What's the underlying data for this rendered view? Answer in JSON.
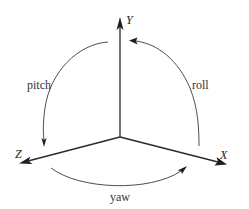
{
  "diagram": {
    "title": "",
    "axes": [
      {
        "id": "y",
        "label": "Y",
        "direction": "up"
      },
      {
        "id": "z",
        "label": "Z",
        "direction": "lower-left"
      },
      {
        "id": "x",
        "label": "X",
        "direction": "lower-right"
      }
    ],
    "rotations": [
      {
        "id": "pitch",
        "label": "pitch",
        "from_axis": "Y",
        "to_axis": "Z"
      },
      {
        "id": "roll",
        "label": "roll",
        "from_axis": "X",
        "to_axis": "Y"
      },
      {
        "id": "yaw",
        "label": "yaw",
        "from_axis": "Z",
        "to_axis": "X"
      }
    ],
    "colors": {
      "background": "#ffffff",
      "lines": "#2a2a2a",
      "text": "#222222"
    }
  }
}
